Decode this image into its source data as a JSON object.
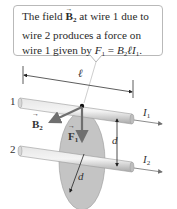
{
  "callout": {
    "line1_prefix": "The field ",
    "line1_vec": "B",
    "line1_sub": "2",
    "line1_suffix": " at wire 1 due to",
    "line2": "wire 2 produces a force on",
    "line3_prefix": "wire 1 given by ",
    "line3_formula_F": "F",
    "line3_formula_Fsub": "1",
    "line3_eq": " = ",
    "line3_formula_B": "B",
    "line3_formula_Bsub": "2",
    "line3_formula_rest": "ℓI",
    "line3_formula_Isub": "1",
    "line3_end": "."
  },
  "labels": {
    "length": "ℓ",
    "wire1": "1",
    "wire2": "2",
    "current1": "I",
    "current1_sub": "1",
    "current2": "I",
    "current2_sub": "2",
    "field": "B",
    "field_sub": "2",
    "force": "F",
    "force_sub": "1",
    "distance_vertical": "d",
    "distance_radius": "d"
  },
  "colors": {
    "wire": "#c8c8c8",
    "disk": "#c4c4c4",
    "arrow": "#6f6f6f",
    "border": "#b9b9b9"
  }
}
